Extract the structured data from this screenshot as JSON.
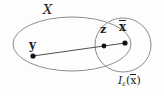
{
  "figure": {
    "background_color": "#fdfdfd",
    "stroke_color": "#8d8d8d",
    "ink_color": "#1c1c1c",
    "labels": {
      "set_label": "X",
      "point_y": "y",
      "point_z": "z",
      "point_xbar_base": "x",
      "ball_symbol": "I",
      "ball_subscript": "ε",
      "ball_open_paren": "(",
      "ball_arg": "x",
      "ball_close_paren": ")"
    },
    "geometry": {
      "ellipse": {
        "cx": 72,
        "cy": 44,
        "rx": 59,
        "ry": 27
      },
      "circle": {
        "cx": 123,
        "cy": 45,
        "rx": 28,
        "ry": 27
      },
      "segment": {
        "x1": 33,
        "y1": 56,
        "x2": 125,
        "y2": 43
      },
      "points": [
        {
          "name": "y",
          "x": 33,
          "y": 56,
          "r": 2.6
        },
        {
          "name": "z",
          "x": 104,
          "y": 46,
          "r": 2.4
        },
        {
          "name": "xbar",
          "x": 125,
          "y": 43,
          "r": 2.6
        }
      ]
    }
  }
}
